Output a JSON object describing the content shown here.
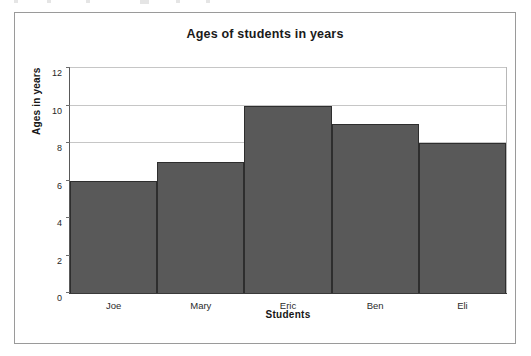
{
  "chart_data": {
    "type": "bar",
    "title": "Ages of students in years",
    "xlabel": "Students",
    "ylabel": "Ages in years",
    "categories": [
      "Joe",
      "Mary",
      "Eric",
      "Ben",
      "Eli"
    ],
    "values": [
      6,
      7,
      10,
      9,
      8
    ],
    "ylim": [
      0,
      12
    ],
    "ytick_labels": [
      "12",
      "10",
      "8",
      "6",
      "4",
      "2",
      "0"
    ],
    "ytick_values": [
      12,
      10,
      8,
      6,
      4,
      2,
      0
    ],
    "ytick_step": 2,
    "grid": "horizontal",
    "gridline_values": [
      12,
      10,
      8
    ],
    "legend": "none",
    "bar_gap": 0,
    "colors": {
      "bar_fill": "#595959",
      "bar_border": "#2e2e2e",
      "gridline": "#c6c6c6",
      "axis": "#3a3a3a",
      "plot_background": "#ffffff",
      "frame_border": "#9a9a9a",
      "text": "#161616"
    }
  }
}
